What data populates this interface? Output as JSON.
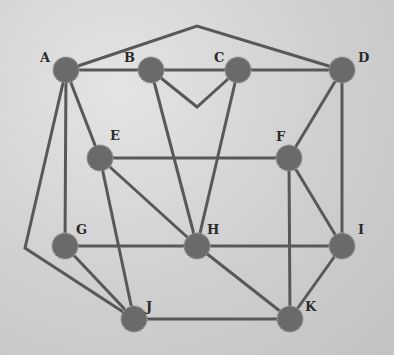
{
  "graph": {
    "colors": {
      "edge": "#585858",
      "node": "#6a6a6a",
      "label": "#2a2a2a"
    },
    "nodes": [
      {
        "id": "A",
        "label": "A",
        "x": 66,
        "y": 70,
        "lx": 40,
        "ly": 62
      },
      {
        "id": "B",
        "label": "B",
        "x": 151,
        "y": 70,
        "lx": 124,
        "ly": 62
      },
      {
        "id": "C",
        "label": "C",
        "x": 238,
        "y": 70,
        "lx": 214,
        "ly": 62
      },
      {
        "id": "D",
        "label": "D",
        "x": 342,
        "y": 70,
        "lx": 358,
        "ly": 62
      },
      {
        "id": "E",
        "label": "E",
        "x": 100,
        "y": 158,
        "lx": 110,
        "ly": 140
      },
      {
        "id": "F",
        "label": "F",
        "x": 289,
        "y": 158,
        "lx": 276,
        "ly": 141
      },
      {
        "id": "G",
        "label": "G",
        "x": 65,
        "y": 246,
        "lx": 76,
        "ly": 234
      },
      {
        "id": "H",
        "label": "H",
        "x": 197,
        "y": 246,
        "lx": 207,
        "ly": 234
      },
      {
        "id": "I",
        "label": "I",
        "x": 342,
        "y": 246,
        "lx": 358,
        "ly": 234
      },
      {
        "id": "J",
        "label": "J",
        "x": 134,
        "y": 319,
        "lx": 146,
        "ly": 311
      },
      {
        "id": "K",
        "label": "K",
        "x": 290,
        "y": 319,
        "lx": 305,
        "ly": 311
      }
    ],
    "edges": [
      {
        "from": "A",
        "to": "D",
        "via": [
          [
            197,
            26
          ]
        ]
      },
      {
        "from": "A",
        "to": "B"
      },
      {
        "from": "B",
        "to": "C"
      },
      {
        "from": "C",
        "to": "D"
      },
      {
        "from": "B",
        "to": "C",
        "via": [
          [
            197,
            107
          ]
        ]
      },
      {
        "from": "A",
        "to": "J",
        "via": [
          [
            25,
            248
          ]
        ]
      },
      {
        "from": "A",
        "to": "G"
      },
      {
        "from": "A",
        "to": "E"
      },
      {
        "from": "E",
        "to": "F"
      },
      {
        "from": "E",
        "to": "H"
      },
      {
        "from": "E",
        "to": "J"
      },
      {
        "from": "B",
        "to": "H"
      },
      {
        "from": "C",
        "to": "H"
      },
      {
        "from": "D",
        "to": "F"
      },
      {
        "from": "D",
        "to": "I"
      },
      {
        "from": "F",
        "to": "I"
      },
      {
        "from": "F",
        "to": "K"
      },
      {
        "from": "G",
        "to": "H"
      },
      {
        "from": "G",
        "to": "J"
      },
      {
        "from": "H",
        "to": "I"
      },
      {
        "from": "H",
        "to": "K"
      },
      {
        "from": "I",
        "to": "K"
      },
      {
        "from": "J",
        "to": "K"
      }
    ]
  }
}
